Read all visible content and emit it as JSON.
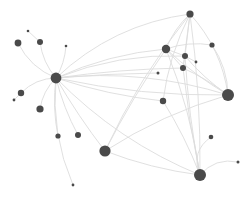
{
  "figure": {
    "kind": "network-graph",
    "title": "",
    "background_color": "#ffffff",
    "node_color": "#4a4a4a",
    "edge_color": "#d8d8d8",
    "width": 249,
    "height": 197
  },
  "chart_data": {
    "type": "scatter",
    "title": "",
    "subtitle": "",
    "xlabel": "",
    "ylabel": "",
    "xlim": [
      0,
      249
    ],
    "ylim": [
      0,
      197
    ],
    "grid": false,
    "legend": null,
    "annotations": [],
    "tick_labels": {
      "x": [],
      "y": []
    },
    "node_color": "#4a4a4a",
    "edge_color": "#dcdcdc",
    "node_count": 24,
    "edge_count": 44,
    "nodes": [
      {
        "id": "n0",
        "x": 56,
        "y": 78,
        "r": 5.4,
        "degree": 18,
        "label": ""
      },
      {
        "id": "n1",
        "x": 18,
        "y": 43,
        "r": 3.4,
        "degree": 2,
        "label": ""
      },
      {
        "id": "n2",
        "x": 40,
        "y": 42,
        "r": 3.0,
        "degree": 2,
        "label": ""
      },
      {
        "id": "n3",
        "x": 28,
        "y": 31,
        "r": 1.3,
        "degree": 1,
        "label": ""
      },
      {
        "id": "n4",
        "x": 66,
        "y": 46,
        "r": 1.3,
        "degree": 1,
        "label": ""
      },
      {
        "id": "n5",
        "x": 21,
        "y": 93,
        "r": 3.2,
        "degree": 2,
        "label": ""
      },
      {
        "id": "n6",
        "x": 14,
        "y": 100,
        "r": 1.4,
        "degree": 1,
        "label": ""
      },
      {
        "id": "n7",
        "x": 40,
        "y": 109,
        "r": 3.6,
        "degree": 2,
        "label": ""
      },
      {
        "id": "n8",
        "x": 58,
        "y": 136,
        "r": 2.6,
        "degree": 2,
        "label": ""
      },
      {
        "id": "n9",
        "x": 78,
        "y": 135,
        "r": 3.0,
        "degree": 2,
        "label": ""
      },
      {
        "id": "n10",
        "x": 105,
        "y": 151,
        "r": 5.6,
        "degree": 7,
        "label": ""
      },
      {
        "id": "n11",
        "x": 73,
        "y": 185,
        "r": 1.4,
        "degree": 1,
        "label": ""
      },
      {
        "id": "n12",
        "x": 190,
        "y": 14,
        "r": 3.6,
        "degree": 8,
        "label": ""
      },
      {
        "id": "n13",
        "x": 166,
        "y": 49,
        "r": 4.2,
        "degree": 7,
        "label": ""
      },
      {
        "id": "n14",
        "x": 185,
        "y": 56,
        "r": 3.0,
        "degree": 6,
        "label": ""
      },
      {
        "id": "n15",
        "x": 212,
        "y": 45,
        "r": 2.6,
        "degree": 2,
        "label": ""
      },
      {
        "id": "n16",
        "x": 183,
        "y": 68,
        "r": 3.0,
        "degree": 5,
        "label": ""
      },
      {
        "id": "n17",
        "x": 196,
        "y": 62,
        "r": 1.4,
        "degree": 1,
        "label": ""
      },
      {
        "id": "n18",
        "x": 158,
        "y": 73,
        "r": 1.5,
        "degree": 1,
        "label": ""
      },
      {
        "id": "n19",
        "x": 228,
        "y": 95,
        "r": 6.0,
        "degree": 7,
        "label": ""
      },
      {
        "id": "n20",
        "x": 163,
        "y": 101,
        "r": 3.2,
        "degree": 3,
        "label": ""
      },
      {
        "id": "n21",
        "x": 200,
        "y": 175,
        "r": 6.0,
        "degree": 6,
        "label": ""
      },
      {
        "id": "n22",
        "x": 211,
        "y": 137,
        "r": 2.3,
        "degree": 1,
        "label": ""
      },
      {
        "id": "n23",
        "x": 238,
        "y": 162,
        "r": 1.5,
        "degree": 1,
        "label": ""
      }
    ],
    "edges": [
      {
        "source": "n0",
        "target": "n1",
        "curve": -10
      },
      {
        "source": "n0",
        "target": "n2",
        "curve": -6
      },
      {
        "source": "n2",
        "target": "n3",
        "curve": 0
      },
      {
        "source": "n0",
        "target": "n4",
        "curve": 4
      },
      {
        "source": "n0",
        "target": "n5",
        "curve": 8
      },
      {
        "source": "n5",
        "target": "n6",
        "curve": 0
      },
      {
        "source": "n0",
        "target": "n7",
        "curve": 6
      },
      {
        "source": "n0",
        "target": "n8",
        "curve": 5
      },
      {
        "source": "n0",
        "target": "n9",
        "curve": 4
      },
      {
        "source": "n0",
        "target": "n10",
        "curve": 3
      },
      {
        "source": "n0",
        "target": "n11",
        "curve": 14
      },
      {
        "source": "n0",
        "target": "n12",
        "curve": -24
      },
      {
        "source": "n0",
        "target": "n13",
        "curve": -10
      },
      {
        "source": "n0",
        "target": "n14",
        "curve": -14
      },
      {
        "source": "n0",
        "target": "n16",
        "curve": -4
      },
      {
        "source": "n0",
        "target": "n19",
        "curve": -18
      },
      {
        "source": "n0",
        "target": "n19",
        "curve": 10
      },
      {
        "source": "n0",
        "target": "n20",
        "curve": 6
      },
      {
        "source": "n0",
        "target": "n21",
        "curve": 18
      },
      {
        "source": "n0",
        "target": "n18",
        "curve": -2
      },
      {
        "source": "n12",
        "target": "n13",
        "curve": 5
      },
      {
        "source": "n12",
        "target": "n14",
        "curve": 0
      },
      {
        "source": "n12",
        "target": "n16",
        "curve": 0
      },
      {
        "source": "n12",
        "target": "n19",
        "curve": -14
      },
      {
        "source": "n12",
        "target": "n20",
        "curve": 8
      },
      {
        "source": "n12",
        "target": "n21",
        "curve": -6
      },
      {
        "source": "n12",
        "target": "n10",
        "curve": 10
      },
      {
        "source": "n13",
        "target": "n14",
        "curve": 0
      },
      {
        "source": "n13",
        "target": "n16",
        "curve": 0
      },
      {
        "source": "n13",
        "target": "n19",
        "curve": 4
      },
      {
        "source": "n13",
        "target": "n21",
        "curve": -8
      },
      {
        "source": "n13",
        "target": "n10",
        "curve": 4
      },
      {
        "source": "n14",
        "target": "n16",
        "curve": 0
      },
      {
        "source": "n14",
        "target": "n17",
        "curve": 0
      },
      {
        "source": "n14",
        "target": "n19",
        "curve": 4
      },
      {
        "source": "n14",
        "target": "n21",
        "curve": 4
      },
      {
        "source": "n15",
        "target": "n13",
        "curve": 6
      },
      {
        "source": "n15",
        "target": "n19",
        "curve": -8
      },
      {
        "source": "n16",
        "target": "n21",
        "curve": 3
      },
      {
        "source": "n16",
        "target": "n19",
        "curve": -3
      },
      {
        "source": "n19",
        "target": "n10",
        "curve": 10
      },
      {
        "source": "n20",
        "target": "n21",
        "curve": -4
      },
      {
        "source": "n21",
        "target": "n22",
        "curve": -16
      },
      {
        "source": "n21",
        "target": "n23",
        "curve": -12
      },
      {
        "source": "n10",
        "target": "n21",
        "curve": 6
      }
    ]
  }
}
